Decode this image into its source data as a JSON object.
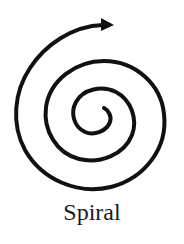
{
  "diagram": {
    "caption": "Spiral",
    "stroke_color": "#111111",
    "background": "#ffffff",
    "shape": "spiral",
    "direction_indicator": "arrow at outer end pointing right"
  }
}
